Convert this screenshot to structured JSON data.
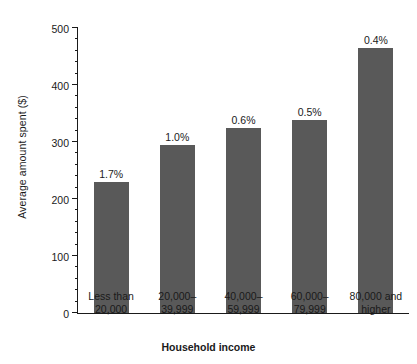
{
  "chart_data": {
    "type": "bar",
    "title": "",
    "xlabel": "Household income",
    "ylabel": "Average amount spent ($)",
    "categories": [
      "Less than\n20,000",
      "20,000–\n39,999",
      "40,000–\n59,999",
      "60,000–\n79,999",
      "80,000 and\nhigher"
    ],
    "category_lines": [
      [
        "Less than",
        "20,000"
      ],
      [
        "20,000–",
        "39,999"
      ],
      [
        "40,000–",
        "59,999"
      ],
      [
        "60,000–",
        "79,999"
      ],
      [
        "80,000 and",
        "higher"
      ]
    ],
    "values": [
      230,
      295,
      325,
      339,
      465
    ],
    "point_labels": [
      "1.7%",
      "1.0%",
      "0.6%",
      "0.5%",
      "0.4%"
    ],
    "ylim": [
      0,
      500
    ],
    "ytick_labels": [
      "0",
      "100",
      "200",
      "300",
      "400",
      "500"
    ],
    "ytick_values": [
      0,
      100,
      200,
      300,
      400,
      500
    ],
    "minor_tick_interval": 20,
    "grid": false,
    "legend": "none",
    "bar_color": "#595959",
    "axis_color": "#1a1a1a",
    "background_color": "#ffffff"
  }
}
